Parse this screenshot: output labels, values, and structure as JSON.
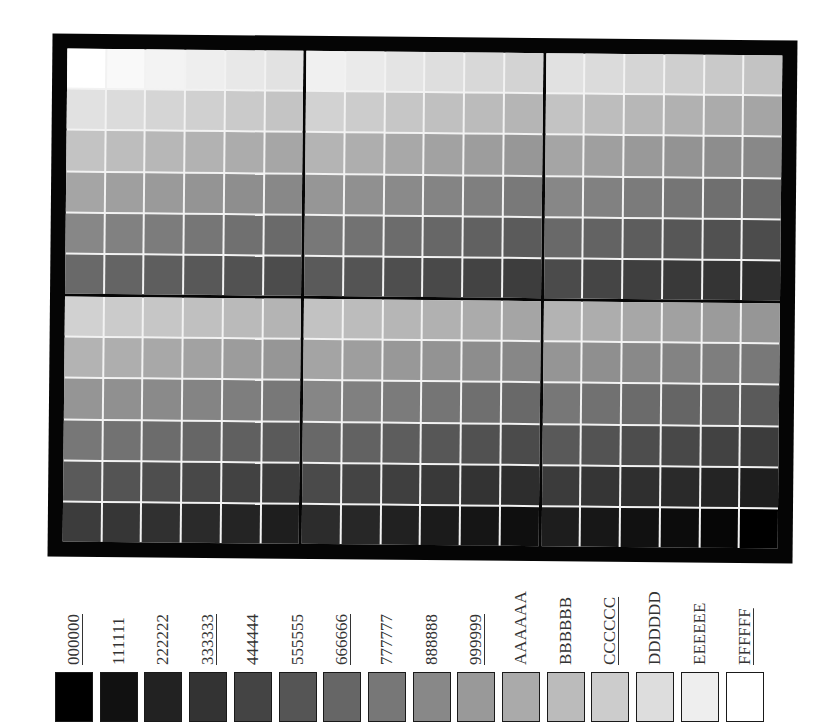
{
  "chart_data": {
    "type": "heatmap",
    "title": "",
    "panel_red_levels": [
      "FF",
      "CC",
      "99",
      "66",
      "33",
      "00"
    ],
    "row_green_levels": [
      "FF",
      "CC",
      "99",
      "66",
      "33",
      "00"
    ],
    "column_blue_levels": [
      "FF",
      "CC",
      "99",
      "66",
      "33",
      "00"
    ],
    "grid": {
      "panels_cols": 3,
      "panels_rows": 2,
      "cells_per_panel": 6
    }
  },
  "legend": {
    "items": [
      {
        "label": "000000",
        "color": "#000000",
        "underlined": true
      },
      {
        "label": "111111",
        "color": "#111111",
        "underlined": false
      },
      {
        "label": "222222",
        "color": "#222222",
        "underlined": false
      },
      {
        "label": "333333",
        "color": "#333333",
        "underlined": true
      },
      {
        "label": "444444",
        "color": "#444444",
        "underlined": false
      },
      {
        "label": "555555",
        "color": "#555555",
        "underlined": false
      },
      {
        "label": "666666",
        "color": "#666666",
        "underlined": true
      },
      {
        "label": "777777",
        "color": "#777777",
        "underlined": false
      },
      {
        "label": "888888",
        "color": "#888888",
        "underlined": false
      },
      {
        "label": "999999",
        "color": "#999999",
        "underlined": true
      },
      {
        "label": "AAAAAA",
        "color": "#AAAAAA",
        "underlined": false
      },
      {
        "label": "BBBBBB",
        "color": "#BBBBBB",
        "underlined": false
      },
      {
        "label": "CCCCCC",
        "color": "#CCCCCC",
        "underlined": true
      },
      {
        "label": "DDDDDD",
        "color": "#DDDDDD",
        "underlined": false
      },
      {
        "label": "EEEEEE",
        "color": "#EEEEEE",
        "underlined": false
      },
      {
        "label": "FFFFFF",
        "color": "#FFFFFF",
        "underlined": true
      }
    ]
  },
  "colors": {
    "frame": "#050505",
    "grid_lines": "#f2f2f2",
    "label_text": "#333333"
  }
}
